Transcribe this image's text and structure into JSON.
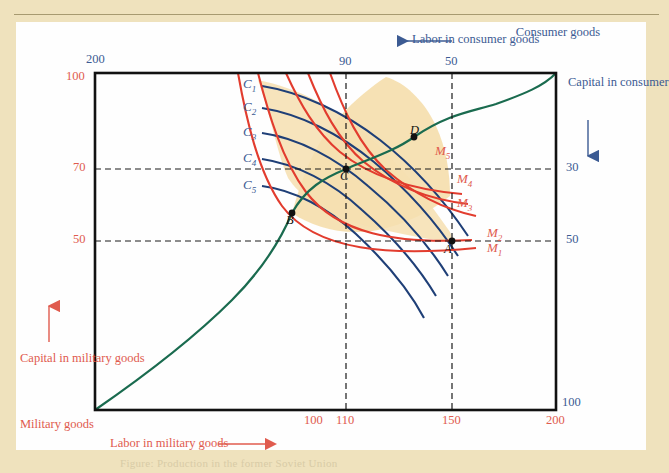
{
  "figure": {
    "type": "edgeworth-box",
    "caption_partial": "Figure:  Production in the former Soviet Union",
    "colors": {
      "consumer_isoquant": "#1f3f77",
      "military_isoquant": "#e23c2e",
      "contract_curve": "#1a6b4f",
      "lens_fill": "#f6dfb0",
      "red_text": "#e05b4e",
      "blue_text": "#3c5b93",
      "frame": "#111111"
    }
  },
  "axes": {
    "top": {
      "label": "Labor in consumer goods",
      "arrow_direction": "left",
      "ticks": [
        {
          "value": "90",
          "x": 346
        },
        {
          "value": "50",
          "x": 452
        }
      ],
      "corner_label": "Consumer goods"
    },
    "left": {
      "label": "Capital in military goods",
      "arrow_direction": "up",
      "origin_label": "Military goods",
      "ticks": [
        {
          "value": "100",
          "y": 78
        },
        {
          "value": "70",
          "y": 169
        },
        {
          "value": "50",
          "y": 241
        }
      ],
      "top_blue_tick": "200"
    },
    "right": {
      "label": "Capital in consumer goods",
      "arrow_direction": "down",
      "ticks": [
        {
          "value": "30",
          "y": 169
        },
        {
          "value": "50",
          "y": 241
        },
        {
          "value": "100",
          "y": 404
        }
      ]
    },
    "bottom": {
      "label": "Labor in military goods",
      "arrow_direction": "right",
      "ticks": [
        {
          "value": "100",
          "x": 315
        },
        {
          "value": "110",
          "x": 346
        },
        {
          "value": "150",
          "x": 452
        },
        {
          "value": "200",
          "x": 556
        }
      ]
    }
  },
  "curves": {
    "consumer_isoquants": [
      {
        "label": "C",
        "sub": "1"
      },
      {
        "label": "C",
        "sub": "2"
      },
      {
        "label": "C",
        "sub": "3"
      },
      {
        "label": "C",
        "sub": "4"
      },
      {
        "label": "C",
        "sub": "5"
      }
    ],
    "military_isoquants": [
      {
        "label": "M",
        "sub": "1"
      },
      {
        "label": "M",
        "sub": "2"
      },
      {
        "label": "M",
        "sub": "3"
      },
      {
        "label": "M",
        "sub": "4"
      },
      {
        "label": "M",
        "sub": "5"
      }
    ]
  },
  "points": [
    {
      "label": "A",
      "x": 452,
      "y": 241
    },
    {
      "label": "B",
      "x": 292,
      "y": 213
    },
    {
      "label": "C",
      "x": 346,
      "y": 169
    },
    {
      "label": "D",
      "x": 414,
      "y": 137
    }
  ]
}
